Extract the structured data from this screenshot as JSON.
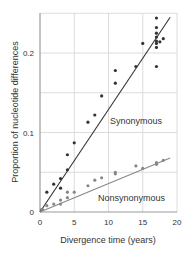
{
  "chart_data": {
    "type": "scatter",
    "title": "",
    "xlabel": "Divergence time (years)",
    "ylabel": "Proportion of nucleotide differences",
    "xlim": [
      0,
      20
    ],
    "ylim": [
      0,
      0.25
    ],
    "xticks": [
      "0",
      "5",
      "10",
      "15",
      "20"
    ],
    "yticks": [
      "0",
      "0.1",
      "0.2"
    ],
    "grid": true,
    "series": [
      {
        "name": "Synonymous",
        "color": "#333333",
        "marker": "dot",
        "trend": [
          [
            0,
            0
          ],
          [
            19,
            0.245
          ]
        ],
        "points": [
          [
            0.3,
            0.003
          ],
          [
            1,
            0.025
          ],
          [
            2,
            0.035
          ],
          [
            3,
            0.03
          ],
          [
            3,
            0.042
          ],
          [
            4,
            0.053
          ],
          [
            4,
            0.072
          ],
          [
            5,
            0.087
          ],
          [
            7,
            0.113
          ],
          [
            8,
            0.122
          ],
          [
            9,
            0.146
          ],
          [
            11,
            0.162
          ],
          [
            11,
            0.178
          ],
          [
            14,
            0.183
          ],
          [
            15,
            0.212
          ],
          [
            17,
            0.244
          ],
          [
            17,
            0.232
          ],
          [
            17,
            0.225
          ],
          [
            17,
            0.22
          ],
          [
            17,
            0.215
          ],
          [
            17,
            0.212
          ],
          [
            17,
            0.207
          ],
          [
            17.5,
            0.214
          ],
          [
            18,
            0.218
          ],
          [
            17,
            0.183
          ]
        ]
      },
      {
        "name": "Nonsynonymous",
        "color": "#888888",
        "marker": "dot",
        "trend": [
          [
            0,
            0
          ],
          [
            19,
            0.068
          ]
        ],
        "points": [
          [
            0.3,
            0.003
          ],
          [
            1,
            0.008
          ],
          [
            2,
            0.01
          ],
          [
            3,
            0.01
          ],
          [
            3,
            0.015
          ],
          [
            4,
            0.018
          ],
          [
            4,
            0.025
          ],
          [
            5,
            0.025
          ],
          [
            7,
            0.033
          ],
          [
            8,
            0.04
          ],
          [
            9,
            0.043
          ],
          [
            11,
            0.048
          ],
          [
            11,
            0.05
          ],
          [
            14,
            0.058
          ],
          [
            15,
            0.055
          ],
          [
            17,
            0.06
          ],
          [
            17,
            0.062
          ],
          [
            18,
            0.065
          ]
        ]
      }
    ],
    "annotations": [
      "Synonymous",
      "Nonsynonymous"
    ]
  }
}
